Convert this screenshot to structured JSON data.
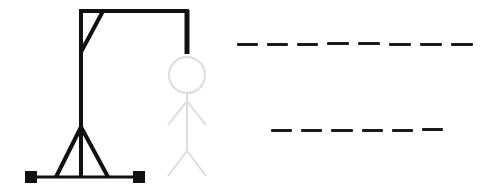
{
  "game": {
    "title": "Hangman",
    "colors": {
      "gallows": "#111111",
      "figure": "#dcdcdc",
      "blanks": "#1a1a1a",
      "background": "#ffffff"
    },
    "figure_parts": [
      "head",
      "body",
      "left-arm",
      "right-arm",
      "left-leg",
      "right-leg"
    ],
    "figure_state": "hidden-light-grey",
    "words": [
      {
        "blanks": 8,
        "letters": [
          "",
          "",
          "",
          "",
          "",
          "",
          "",
          ""
        ]
      },
      {
        "blanks": 6,
        "letters": [
          "",
          "",
          "",
          "",
          "",
          ""
        ]
      }
    ]
  }
}
